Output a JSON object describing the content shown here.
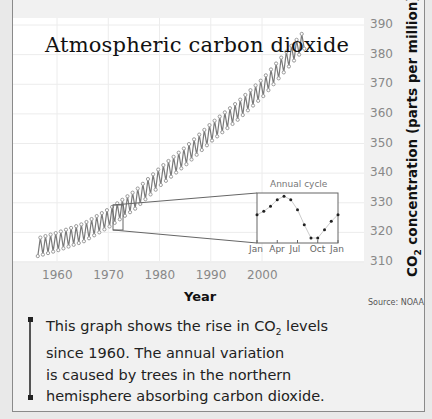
{
  "chart_data": {
    "type": "line",
    "title": "Atmospheric carbon dioxide",
    "xlabel": "Year",
    "ylabel": "CO2 concentration (parts per million)",
    "xlim": [
      1951,
      2020
    ],
    "ylim": [
      308,
      392
    ],
    "x_ticks": [
      1960,
      1970,
      1980,
      1990,
      2000
    ],
    "y_ticks": [
      310,
      320,
      330,
      340,
      350,
      360,
      370,
      380,
      390
    ],
    "grid": true,
    "series": [
      {
        "name": "Monthly CO2 (seasonal high/low)",
        "x": [
          1956,
          1960,
          1965,
          1970,
          1975,
          1980,
          1985,
          1990,
          1995,
          2000,
          2005,
          2008
        ],
        "values": [
          315,
          317,
          320,
          325,
          331,
          339,
          346,
          354,
          361,
          369,
          379,
          385
        ]
      }
    ],
    "seasonal_amplitude_ppm": 6,
    "inset": {
      "title": "Annual cycle",
      "type": "scatter-line",
      "categories": [
        "Jan",
        "Feb",
        "Mar",
        "Apr",
        "May",
        "Jun",
        "Jul",
        "Aug",
        "Sep",
        "Oct",
        "Nov",
        "Dec",
        "Jan"
      ],
      "tick_labels": [
        "Jan",
        "Apr",
        "Jul",
        "Oct",
        "Jan"
      ],
      "values": [
        325.5,
        326.5,
        328,
        330,
        331,
        330,
        327,
        322.5,
        318.5,
        318.5,
        321,
        323.5,
        325.5
      ]
    },
    "annotations": [
      "Source: NOAA"
    ]
  },
  "labels": {
    "title": "Atmospheric carbon dioxide",
    "xlabel": "Year",
    "ylabel_prefix": "CO",
    "ylabel_sub": "2",
    "ylabel_suffix": " concentration (parts per million)",
    "source": "Source: NOAA",
    "inset_title": "Annual cycle",
    "y_ticks": [
      "390",
      "380",
      "370",
      "360",
      "350",
      "340",
      "330",
      "320",
      "310"
    ],
    "x_ticks": [
      "1960",
      "1970",
      "1980",
      "1990",
      "2000"
    ],
    "inset_ticks": [
      "Jan",
      "Apr",
      "Jul",
      "Oct",
      "Jan"
    ]
  },
  "caption": {
    "line1_pre": "This graph shows the rise in CO",
    "line1_sub": "2",
    "line1_post": " levels",
    "line2": "since 1960. The annual variation",
    "line3": "is caused by trees in the northern",
    "line4": "hemisphere absorbing carbon dioxide."
  },
  "colors": {
    "line": "#7a7a7a",
    "marker": "#9a9a9a",
    "grid": "#ececec",
    "frame_bg": "#f1f1f1",
    "plot_bg": "#ffffff"
  }
}
